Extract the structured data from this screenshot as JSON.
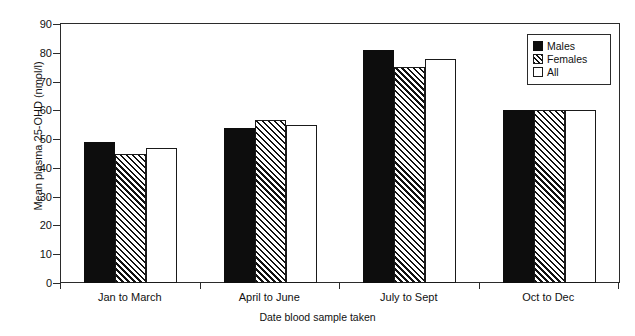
{
  "chart_data": {
    "type": "bar",
    "title": "",
    "xlabel": "Date blood sample taken",
    "ylabel": "Mean plasma 25-OHD (nmol/l)",
    "categories": [
      "Jan to March",
      "April to June",
      "July to Sept",
      "Oct to Dec"
    ],
    "series": [
      {
        "name": "Males",
        "values": [
          49,
          54,
          81,
          60
        ]
      },
      {
        "name": "Females",
        "values": [
          45,
          56.5,
          75,
          60
        ]
      },
      {
        "name": "All",
        "values": [
          47,
          55,
          78,
          60
        ]
      }
    ],
    "ylim": [
      0,
      90
    ],
    "yticks": [
      0,
      10,
      20,
      30,
      40,
      50,
      60,
      70,
      80,
      90
    ],
    "ytick_labels": [
      "0",
      "10",
      "20",
      "30",
      "40",
      "50",
      "60",
      "70",
      "80",
      "90"
    ],
    "grid": false,
    "legend_position": "top-right",
    "legend_entries": [
      "Males",
      "Females",
      "All"
    ],
    "colors": {
      "males": "#0d0d0d",
      "females": "#ffffff",
      "all": "#ffffff",
      "outline": "#1a1a1a",
      "axis": "#2b2b2b"
    }
  }
}
